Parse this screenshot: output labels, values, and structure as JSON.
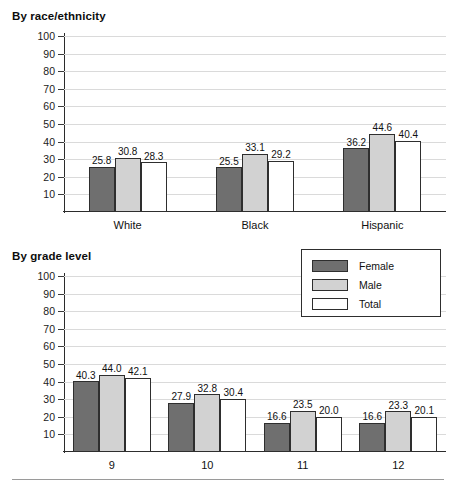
{
  "figure": {
    "legend": {
      "position": "top-right-of-lower-panel",
      "entries": [
        {
          "label": "Female",
          "color": "#6f6f6f",
          "swatch": "female"
        },
        {
          "label": "Male",
          "color": "#d2d2d2",
          "swatch": "male"
        },
        {
          "label": "Total",
          "color": "#ffffff",
          "swatch": "total"
        }
      ]
    },
    "colors": {
      "female": "#6f6f6f",
      "male": "#d2d2d2",
      "total": "#ffffff",
      "bar_outline": "#2e2e2e",
      "gridline": "#dadada",
      "axis": "#2b2b2b"
    }
  },
  "chart_data": [
    {
      "type": "bar",
      "title": "By race/ethnicity",
      "xlabel": "",
      "ylabel": "",
      "ylim": [
        0,
        100
      ],
      "yticks": [
        10,
        20,
        30,
        40,
        50,
        60,
        70,
        80,
        90,
        100
      ],
      "ytick_labels": [
        "10",
        "20",
        "30",
        "40",
        "50",
        "60",
        "70",
        "80",
        "90",
        "100"
      ],
      "grid": true,
      "legend": "shared",
      "categories": [
        "White",
        "Black",
        "Hispanic"
      ],
      "series": [
        {
          "name": "Female",
          "values": [
            25.8,
            25.5,
            36.2
          ],
          "labels": [
            "25.8",
            "25.5",
            "36.2"
          ]
        },
        {
          "name": "Male",
          "values": [
            30.8,
            33.1,
            44.6
          ],
          "labels": [
            "30.8",
            "33.1",
            "44.6"
          ]
        },
        {
          "name": "Total",
          "values": [
            28.3,
            29.2,
            40.4
          ],
          "labels": [
            "28.3",
            "29.2",
            "40.4"
          ]
        }
      ]
    },
    {
      "type": "bar",
      "title": "By grade level",
      "xlabel": "",
      "ylabel": "",
      "ylim": [
        0,
        100
      ],
      "yticks": [
        10,
        20,
        30,
        40,
        50,
        60,
        70,
        80,
        90,
        100
      ],
      "ytick_labels": [
        "10",
        "20",
        "30",
        "40",
        "50",
        "60",
        "70",
        "80",
        "90",
        "100"
      ],
      "grid": true,
      "legend": "top-right",
      "categories": [
        "9",
        "10",
        "11",
        "12"
      ],
      "series": [
        {
          "name": "Female",
          "values": [
            40.3,
            27.9,
            16.6,
            16.6
          ],
          "labels": [
            "40.3",
            "27.9",
            "16.6",
            "16.6"
          ]
        },
        {
          "name": "Male",
          "values": [
            44.0,
            32.8,
            23.5,
            23.3
          ],
          "labels": [
            "44.0",
            "32.8",
            "23.5",
            "23.3"
          ]
        },
        {
          "name": "Total",
          "values": [
            42.1,
            30.4,
            20.0,
            20.1
          ],
          "labels": [
            "42.1",
            "30.4",
            "20.0",
            "20.1"
          ]
        }
      ]
    }
  ]
}
